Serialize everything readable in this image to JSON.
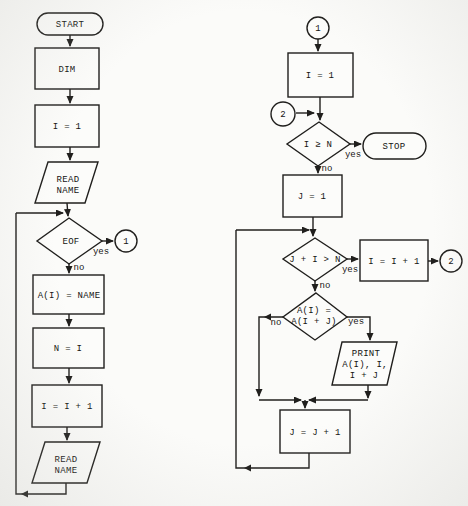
{
  "left": {
    "start": "START",
    "dim": "DIM",
    "i1": "I = 1",
    "read1": {
      "l1": "READ",
      "l2": "NAME"
    },
    "eof": "EOF",
    "conn1": "1",
    "assign": "A(I) = NAME",
    "ni": "N = I",
    "inc": "I = I + 1",
    "read2": {
      "l1": "READ",
      "l2": "NAME"
    },
    "yes": "yes",
    "no": "no"
  },
  "right": {
    "conn1": "1",
    "i1": "I = 1",
    "conn2a": "2",
    "cond1": "I ≥ N",
    "stop": "STOP",
    "j1": "J = 1",
    "cond2": "J + I > N",
    "inc": "I = I + 1",
    "conn2b": "2",
    "cond3": {
      "l1": "A(I) =",
      "l2": "A(I + J)"
    },
    "print": {
      "l1": "PRINT",
      "l2": "A(I), I,",
      "l3": "I + J"
    },
    "jinc": "J = J + 1",
    "yes": "yes",
    "no": "no"
  }
}
